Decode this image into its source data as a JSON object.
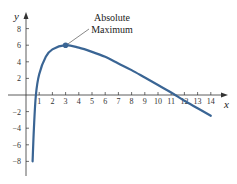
{
  "chart_data": {
    "type": "line",
    "title": "",
    "xlabel": "x",
    "ylabel": "y",
    "xlim": [
      0,
      14.5
    ],
    "ylim": [
      -9,
      9
    ],
    "x_ticks": [
      1,
      2,
      3,
      4,
      5,
      6,
      7,
      8,
      9,
      10,
      11,
      12,
      13,
      14
    ],
    "y_ticks": [
      -8,
      -6,
      -4,
      -2,
      2,
      4,
      6,
      8
    ],
    "grid": false,
    "series": [
      {
        "name": "f(x)",
        "color": "#3a6594",
        "points": [
          [
            0.5,
            -8
          ],
          [
            0.6,
            -4
          ],
          [
            0.75,
            0
          ],
          [
            1,
            2.5
          ],
          [
            1.5,
            4.6
          ],
          [
            2,
            5.5
          ],
          [
            3,
            6
          ],
          [
            4,
            5.7
          ],
          [
            5,
            5.2
          ],
          [
            6,
            4.6
          ],
          [
            7,
            3.8
          ],
          [
            8,
            3.0
          ],
          [
            9,
            2.1
          ],
          [
            10,
            1.2
          ],
          [
            11,
            0.3
          ],
          [
            11.3,
            0
          ],
          [
            12,
            -0.7
          ],
          [
            13,
            -1.6
          ],
          [
            14,
            -2.5
          ]
        ]
      }
    ],
    "annotations": [
      {
        "text_line1": "Absolute",
        "text_line2": "Maximum",
        "point": [
          3,
          6
        ]
      }
    ]
  }
}
